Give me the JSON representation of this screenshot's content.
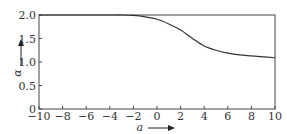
{
  "chart_data": {
    "type": "line",
    "title": "",
    "xlabel": "a",
    "ylabel": "α",
    "xlim": [
      -10,
      10
    ],
    "ylim": [
      0,
      2.0
    ],
    "grid": false,
    "legend": null,
    "xticks": [
      "−10",
      "−8",
      "−6",
      "−4",
      "−2",
      "0",
      "2",
      "4",
      "6",
      "8",
      "10"
    ],
    "yticks": [
      "0",
      "0.5",
      "1.0",
      "1.5",
      "2.0"
    ],
    "series": [
      {
        "name": "α(a)",
        "x": [
          -10,
          -8,
          -6,
          -4,
          -3,
          -2,
          -1,
          0,
          1,
          2,
          3,
          4,
          5,
          6,
          7,
          8,
          9,
          10
        ],
        "y": [
          2.0,
          2.0,
          2.0,
          2.0,
          2.0,
          1.99,
          1.96,
          1.91,
          1.81,
          1.68,
          1.5,
          1.34,
          1.25,
          1.19,
          1.15,
          1.13,
          1.11,
          1.09
        ]
      }
    ]
  }
}
